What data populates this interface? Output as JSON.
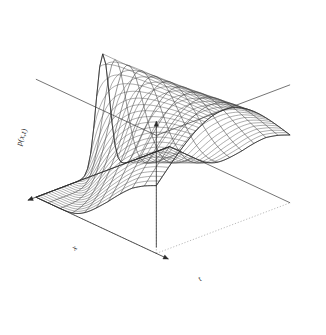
{
  "figure": {
    "kind": "3d-wireframe-surface",
    "renderer_style": "R persp mesh plot",
    "background_color": "#ffffff",
    "line_color": "#3c3c3c",
    "hidden_edge_color": "#8c8c8c",
    "axis_color": "#2b2b2b",
    "width": 326,
    "height": 335
  },
  "axes": {
    "x": {
      "label": "x",
      "label_x": 76,
      "label_y": 250,
      "rotation": -34
    },
    "t": {
      "label": "t",
      "label_x": 201,
      "label_y": 281,
      "rotation": -28
    },
    "z": {
      "label": "p(x,t)",
      "label_x": 24,
      "label_y": 138,
      "rotation": -69
    }
  },
  "chart_data": {
    "type": "surface",
    "title": "",
    "xlabel": "x",
    "ylabel": "t",
    "zlabel": "p(x,t)",
    "xlim": [
      -1,
      1
    ],
    "ylim": [
      0,
      1
    ],
    "zlim": [
      0,
      1
    ],
    "grid": false,
    "legend": "none",
    "nx": 44,
    "nt": 11,
    "surface_function": "p(x,t) = exp(-x^2 / (2*s(t)^2)) with s(t) growing from 0.10 to 0.95",
    "t_values": [
      0.0,
      0.1,
      0.2,
      0.3,
      0.4,
      0.5,
      0.6,
      0.7,
      0.8,
      0.9,
      1.0
    ],
    "sigma_values": [
      0.1,
      0.17,
      0.25,
      0.33,
      0.42,
      0.51,
      0.6,
      0.7,
      0.8,
      0.88,
      0.95
    ],
    "peak_heights": [
      1.0,
      1.0,
      1.0,
      1.0,
      1.0,
      1.0,
      1.0,
      1.0,
      1.0,
      1.0,
      1.0
    ]
  },
  "projection": {
    "theta_deg": 42,
    "phi_deg": 24,
    "scale": 150,
    "origin_x": 163,
    "origin_y": 200,
    "z_scale": 118
  },
  "box_corners": {
    "top_left": [
      23,
      57
    ],
    "top_apex": [
      183,
      18
    ],
    "right": [
      250,
      225
    ],
    "bottom": [
      113,
      318
    ],
    "front_base": [
      258,
      238
    ]
  }
}
